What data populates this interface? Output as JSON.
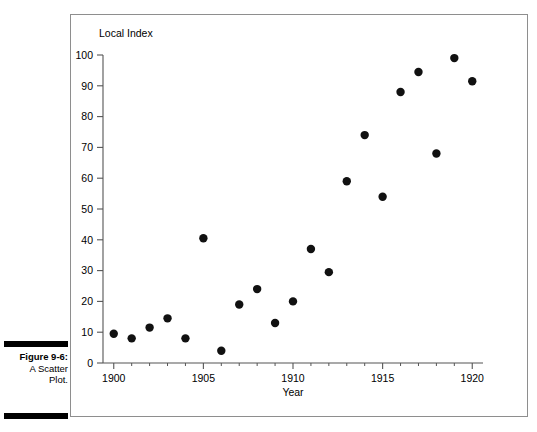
{
  "figure": {
    "caption_number": "Figure 9-6:",
    "caption_line1": "A Scatter",
    "caption_line2": "Plot."
  },
  "colors": {
    "point": "#111111",
    "axis": "#555555",
    "frame": "#8e8e8e",
    "background": "#ffffff",
    "text": "#000000"
  },
  "chart_data": {
    "type": "scatter",
    "title": "",
    "ylabel": "Local Index",
    "xlabel": "Year",
    "xlim": [
      1899.4,
      1920.6
    ],
    "ylim": [
      0,
      100
    ],
    "grid": false,
    "legend": false,
    "y_ticks": [
      0,
      10,
      20,
      30,
      40,
      50,
      60,
      70,
      80,
      90,
      100
    ],
    "y_tick_labels": [
      "0",
      "10",
      "20",
      "30",
      "40",
      "50",
      "60",
      "70",
      "80",
      "90",
      "100"
    ],
    "x_ticks": [
      1900,
      1905,
      1910,
      1915,
      1920
    ],
    "x_tick_labels": [
      "1900",
      "1905",
      "1910",
      "1915",
      "1920"
    ],
    "x_minor_ticks": [
      1901,
      1902,
      1903,
      1904,
      1906,
      1907,
      1908,
      1909,
      1911,
      1912,
      1913,
      1914,
      1916,
      1917,
      1918,
      1919
    ],
    "x": [
      1900,
      1901,
      1902,
      1903,
      1904,
      1905,
      1906,
      1907,
      1908,
      1909,
      1910,
      1911,
      1912,
      1913,
      1914,
      1915,
      1916,
      1917,
      1918,
      1919,
      1920
    ],
    "y": [
      9.5,
      8,
      11.5,
      14.5,
      8,
      40.5,
      4,
      19,
      24,
      13,
      20,
      37,
      29.5,
      59,
      74,
      54,
      88,
      94.5,
      68,
      99,
      91.5
    ],
    "points": [
      {
        "x": 1900,
        "y": 9.5
      },
      {
        "x": 1901,
        "y": 8
      },
      {
        "x": 1902,
        "y": 11.5
      },
      {
        "x": 1903,
        "y": 14.5
      },
      {
        "x": 1904,
        "y": 8
      },
      {
        "x": 1905,
        "y": 40.5
      },
      {
        "x": 1906,
        "y": 4
      },
      {
        "x": 1907,
        "y": 19
      },
      {
        "x": 1908,
        "y": 24
      },
      {
        "x": 1909,
        "y": 13
      },
      {
        "x": 1910,
        "y": 20
      },
      {
        "x": 1911,
        "y": 37
      },
      {
        "x": 1912,
        "y": 29.5
      },
      {
        "x": 1913,
        "y": 59
      },
      {
        "x": 1914,
        "y": 74
      },
      {
        "x": 1915,
        "y": 54
      },
      {
        "x": 1916,
        "y": 88
      },
      {
        "x": 1917,
        "y": 94.5
      },
      {
        "x": 1918,
        "y": 68
      },
      {
        "x": 1919,
        "y": 99
      },
      {
        "x": 1920,
        "y": 91.5
      }
    ]
  }
}
